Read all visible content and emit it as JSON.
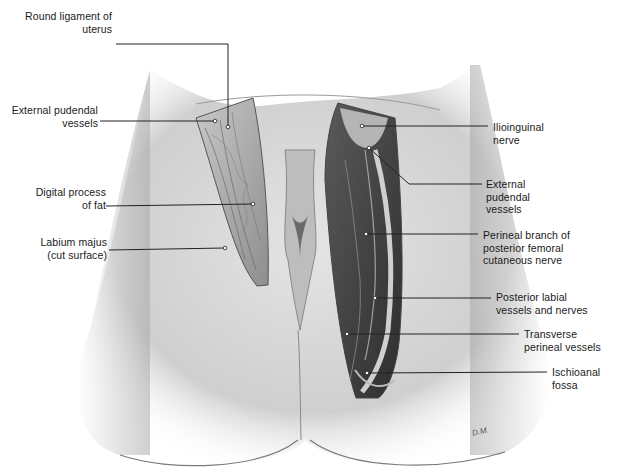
{
  "figure": {
    "type": "anatomical-illustration",
    "palette": {
      "background": "#ffffff",
      "skin": "#d9d9d9",
      "skin_shadow": "#9a9a9a",
      "dissection_light": "#bdbdbd",
      "dissection_dark": "#3e3e3e",
      "leader": "#222222"
    },
    "signature": "D.M."
  },
  "labels": [
    {
      "id": "round-ligament",
      "side": "left",
      "text": "Round ligament of\nuterus",
      "x": 4,
      "y": 10,
      "w": 108,
      "line": [
        [
          116,
          44
        ],
        [
          228,
          44
        ],
        [
          228,
          127
        ]
      ]
    },
    {
      "id": "external-pudendal-left",
      "side": "left",
      "text": "External pudendal\nvessels",
      "x": 4,
      "y": 104,
      "w": 94,
      "line": [
        [
          100,
          121
        ],
        [
          215,
          121
        ]
      ]
    },
    {
      "id": "digital-process",
      "side": "left",
      "text": "Digital process\nof fat",
      "x": 4,
      "y": 186,
      "w": 102,
      "line": [
        [
          106,
          206
        ],
        [
          253,
          204
        ]
      ]
    },
    {
      "id": "labium-majus",
      "side": "left",
      "text": "Labium majus\n(cut surface)",
      "x": 4,
      "y": 236,
      "w": 103,
      "line": [
        [
          109,
          250
        ],
        [
          225,
          248
        ]
      ]
    },
    {
      "id": "ilioinguinal",
      "side": "right",
      "text": "Ilioinguinal\nnerve",
      "x": 493,
      "y": 121,
      "w": 100,
      "line": [
        [
          362,
          126
        ],
        [
          488,
          126
        ]
      ]
    },
    {
      "id": "external-pudendal-right",
      "side": "right",
      "text": "External\npudendal\nvessels",
      "x": 486,
      "y": 178,
      "w": 100,
      "line": [
        [
          369,
          148
        ],
        [
          409,
          184
        ],
        [
          482,
          184
        ]
      ]
    },
    {
      "id": "perineal-branch",
      "side": "right",
      "text": "Perineal branch of\nposterior femoral\ncutaneous nerve",
      "x": 483,
      "y": 229,
      "w": 130,
      "line": [
        [
          366,
          234
        ],
        [
          478,
          234
        ]
      ]
    },
    {
      "id": "posterior-labial",
      "side": "right",
      "text": "Posterior labial\nvessels and nerves",
      "x": 496,
      "y": 291,
      "w": 120,
      "line": [
        [
          375,
          298
        ],
        [
          491,
          298
        ]
      ]
    },
    {
      "id": "transverse-perineal",
      "side": "right",
      "text": "Transverse\nperineal vessels",
      "x": 524,
      "y": 328,
      "w": 93,
      "line": [
        [
          347,
          334
        ],
        [
          519,
          334
        ]
      ]
    },
    {
      "id": "ischioanal-fossa",
      "side": "right",
      "text": "Ischioanal\nfossa",
      "x": 552,
      "y": 366,
      "w": 65,
      "line": [
        [
          367,
          373
        ],
        [
          547,
          372
        ]
      ]
    }
  ]
}
